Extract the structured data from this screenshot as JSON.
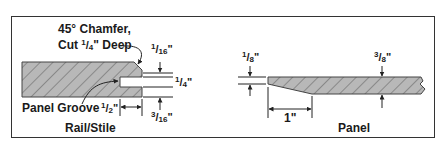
{
  "figure": {
    "left_diagram": {
      "caption": "Rail/Stile",
      "callouts": {
        "chamfer_line1": "45° Chamfer,",
        "chamfer_line2_prefix": "Cut ",
        "chamfer_num": "1",
        "chamfer_den": "4",
        "chamfer_line2_suffix": "\" Deep",
        "groove": "Panel Groove"
      },
      "dimensions": {
        "top_gap": {
          "num": "1",
          "den": "16",
          "unit": "\""
        },
        "groove_width": {
          "num": "1",
          "den": "4",
          "unit": "\""
        },
        "bottom_gap": {
          "num": "3",
          "den": "16",
          "unit": "\""
        },
        "groove_depth": {
          "num": "1",
          "den": "2",
          "unit": "\""
        }
      }
    },
    "right_diagram": {
      "caption": "Panel",
      "dimensions": {
        "edge_thickness": {
          "num": "1",
          "den": "8",
          "unit": "\""
        },
        "panel_thickness": {
          "num": "3",
          "den": "8",
          "unit": "\""
        },
        "bevel_length": "1\""
      }
    },
    "colors": {
      "wood_fill": "#b8b8b8",
      "hatch": "#6a6a6a",
      "line": "#222222",
      "frame": "#333333"
    }
  }
}
